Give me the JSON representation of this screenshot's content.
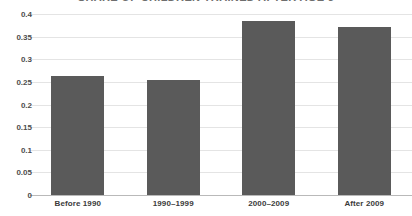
{
  "chart_data": {
    "type": "bar",
    "title": "SHARE OF CHILDREN TRAINED AFTER AGE 5",
    "xlabel": "",
    "ylabel": "",
    "categories": [
      "Before 1990",
      "1990–1999",
      "2000–2009",
      "After 2009"
    ],
    "values": [
      0.263,
      0.254,
      0.385,
      0.372
    ],
    "ylim": [
      0,
      0.4
    ],
    "ytick_labels": [
      "0",
      "0.05",
      "0.1",
      "0.15",
      "0.2",
      "0.25",
      "0.3",
      "0.35",
      "0.4"
    ],
    "ytick_values": [
      0,
      0.05,
      0.1,
      0.15,
      0.2,
      0.25,
      0.3,
      0.35,
      0.4
    ],
    "grid": true,
    "legend": false,
    "bar_color": "#5a5a5a",
    "grid_color": "#e4e4e4",
    "axis_color": "#b9b9b9",
    "title_color": "#6e6e6e",
    "label_color": "#3b3b3b"
  }
}
